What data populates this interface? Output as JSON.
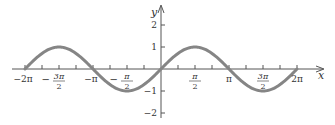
{
  "chart_data": {
    "type": "line",
    "title": "",
    "function": "y = sin(x)",
    "xlabel": "x",
    "ylabel": "y",
    "xlim": [
      -6.2832,
      6.2832
    ],
    "ylim": [
      -2,
      2
    ],
    "grid": false,
    "legend": null,
    "x_tick_labels": [
      "-2π",
      "-3π/2",
      "-π",
      "-π/2",
      "π/2",
      "π",
      "3π/2",
      "2π"
    ],
    "x_tick_values": [
      -6.2832,
      -4.7124,
      -3.1416,
      -1.5708,
      1.5708,
      3.1416,
      4.7124,
      6.2832
    ],
    "x_minor_tick_step": 0.7854,
    "y_tick_labels": [
      "-2",
      "-1",
      "1",
      "2"
    ],
    "y_tick_values": [
      -2,
      -1,
      1,
      2
    ],
    "series": [
      {
        "name": "sin x",
        "color": "#858585",
        "x": [
          -6.2832,
          -5.4978,
          -4.7124,
          -3.927,
          -3.1416,
          -2.3562,
          -1.5708,
          -0.7854,
          0,
          0.7854,
          1.5708,
          2.3562,
          3.1416,
          3.927,
          4.7124,
          5.4978,
          6.2832
        ],
        "values": [
          0,
          0.707,
          1,
          0.707,
          0,
          -0.707,
          -1,
          -0.707,
          0,
          0.707,
          1,
          0.707,
          0,
          -0.707,
          -1,
          -0.707,
          0
        ]
      }
    ]
  },
  "axes": {
    "x_axis_label": "x",
    "y_axis_label": "y",
    "curve_color": "#858585",
    "axis_color": "#555555"
  }
}
